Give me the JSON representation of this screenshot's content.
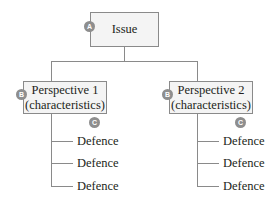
{
  "diagram": {
    "root": {
      "label": "Issue",
      "badge": "A"
    },
    "perspectives": [
      {
        "title": "Perspective 1",
        "subtitle": "(characteristics)",
        "badge": "B",
        "defence_badge": "C",
        "defences": [
          "Defence",
          "Defence",
          "Defence"
        ]
      },
      {
        "title": "Perspective 2",
        "subtitle": "(characteristics)",
        "badge": "B",
        "defence_badge": "C",
        "defences": [
          "Defence",
          "Defence",
          "Defence"
        ]
      }
    ],
    "colors": {
      "line": "#8a8a8a",
      "box_fill": "#f4f4f4",
      "badge": "#8e8e8e"
    }
  }
}
